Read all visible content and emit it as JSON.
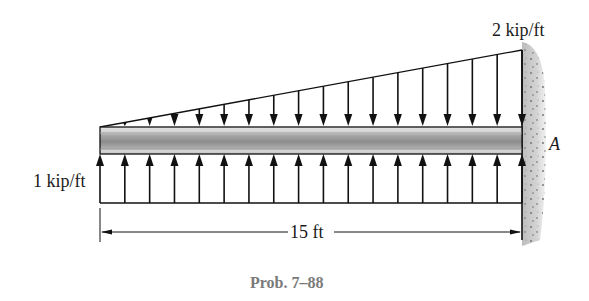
{
  "figure": {
    "caption": "Prob. 7–88",
    "beam": {
      "length_label": "15 ft",
      "support_label": "A",
      "support_type": "fixed-wall",
      "x_left": 100,
      "x_right": 522,
      "y_top": 127,
      "y_bottom": 153
    },
    "loads": {
      "top_distributed": {
        "label": "2 kip/ft",
        "shape": "triangular",
        "direction": "down",
        "intensity_left": 0,
        "intensity_right": 2,
        "units": "kip/ft",
        "arrow_count": 18
      },
      "bottom_distributed": {
        "label": "1 kip/ft",
        "shape": "uniform",
        "direction": "up",
        "intensity": 1,
        "units": "kip/ft",
        "arrow_count": 18
      }
    },
    "colors": {
      "line": "#111111",
      "beam_light": "#d8d8d8",
      "beam_dark": "#8a8a8a",
      "wall": "#c9c9c9",
      "caption": "#7a7a7a"
    }
  }
}
